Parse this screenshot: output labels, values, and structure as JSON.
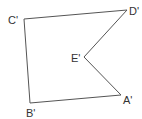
{
  "diagram": {
    "type": "polygon",
    "shape": "concave pentagon",
    "stroke_color": "#555555",
    "vertices": [
      {
        "name": "A'",
        "x": 121,
        "y": 95,
        "label_x": 123,
        "label_y": 104
      },
      {
        "name": "B'",
        "x": 30,
        "y": 103,
        "label_x": 26,
        "label_y": 117
      },
      {
        "name": "C'",
        "x": 24,
        "y": 19,
        "label_x": 8,
        "label_y": 24
      },
      {
        "name": "D'",
        "x": 127,
        "y": 10,
        "label_x": 129,
        "label_y": 15
      },
      {
        "name": "E'",
        "x": 84,
        "y": 57,
        "label_x": 71,
        "label_y": 62
      }
    ],
    "edges": [
      [
        "A'",
        "B'"
      ],
      [
        "B'",
        "C'"
      ],
      [
        "C'",
        "D'"
      ],
      [
        "D'",
        "E'"
      ],
      [
        "E'",
        "A'"
      ]
    ]
  }
}
